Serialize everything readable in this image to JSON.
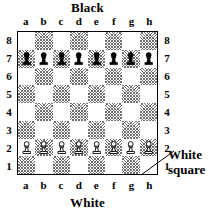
{
  "diagram": {
    "title_top": "Black",
    "title_bottom": "White",
    "files": [
      "a",
      "b",
      "c",
      "d",
      "e",
      "f",
      "g",
      "h"
    ],
    "ranks": [
      "8",
      "7",
      "6",
      "5",
      "4",
      "3",
      "2",
      "1"
    ],
    "annotation": {
      "line1": "White",
      "line2": "square",
      "points_to": "h1"
    },
    "colors": {
      "light_square": "#ffffff",
      "dark_square_hatch": "#6e6e6e",
      "border": "#000000",
      "text": "#000000"
    }
  },
  "chart_data": {
    "type": "table",
    "xlabel": "files a-h",
    "ylabel": "ranks 1-8",
    "files": [
      "a",
      "b",
      "c",
      "d",
      "e",
      "f",
      "g",
      "h"
    ],
    "ranks": [
      "8",
      "7",
      "6",
      "5",
      "4",
      "3",
      "2",
      "1"
    ],
    "square_colors": [
      [
        "light",
        "dark",
        "light",
        "dark",
        "light",
        "dark",
        "light",
        "dark"
      ],
      [
        "dark",
        "light",
        "dark",
        "light",
        "dark",
        "light",
        "dark",
        "light"
      ],
      [
        "light",
        "dark",
        "light",
        "dark",
        "light",
        "dark",
        "light",
        "dark"
      ],
      [
        "dark",
        "light",
        "dark",
        "light",
        "dark",
        "light",
        "dark",
        "light"
      ],
      [
        "light",
        "dark",
        "light",
        "dark",
        "light",
        "dark",
        "light",
        "dark"
      ],
      [
        "dark",
        "light",
        "dark",
        "light",
        "dark",
        "light",
        "dark",
        "light"
      ],
      [
        "light",
        "dark",
        "light",
        "dark",
        "light",
        "dark",
        "light",
        "dark"
      ],
      [
        "dark",
        "light",
        "dark",
        "light",
        "dark",
        "light",
        "dark",
        "light"
      ]
    ],
    "pieces": [
      [
        "",
        "",
        "",
        "",
        "",
        "",
        "",
        ""
      ],
      [
        "black-pawn",
        "black-pawn",
        "black-pawn",
        "black-pawn",
        "black-pawn",
        "black-pawn",
        "black-pawn",
        "black-pawn"
      ],
      [
        "",
        "",
        "",
        "",
        "",
        "",
        "",
        ""
      ],
      [
        "",
        "",
        "",
        "",
        "",
        "",
        "",
        ""
      ],
      [
        "",
        "",
        "",
        "",
        "",
        "",
        "",
        ""
      ],
      [
        "",
        "",
        "",
        "",
        "",
        "",
        "",
        ""
      ],
      [
        "white-pawn",
        "white-pawn",
        "white-pawn",
        "white-pawn",
        "white-pawn",
        "white-pawn",
        "white-pawn",
        "white-pawn"
      ],
      [
        "",
        "",
        "",
        "",
        "",
        "",
        "",
        ""
      ]
    ],
    "annotations": [
      {
        "text": "White square",
        "target": "h1"
      }
    ]
  }
}
